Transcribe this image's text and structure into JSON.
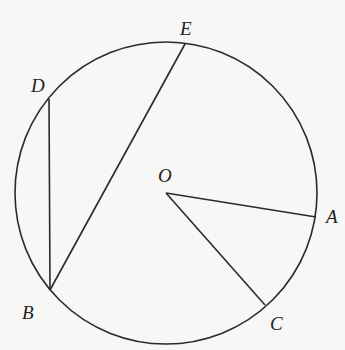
{
  "diagram": {
    "type": "circle-geometry",
    "circle": {
      "center": "O",
      "cx": 166,
      "cy": 193,
      "r": 151
    },
    "points": [
      {
        "id": "O",
        "label": "O",
        "x": 166,
        "y": 193,
        "lx": 158,
        "ly": 182
      },
      {
        "id": "A",
        "label": "A",
        "x": 316,
        "y": 217,
        "lx": 326,
        "ly": 223
      },
      {
        "id": "B",
        "label": "B",
        "x": 50,
        "y": 290,
        "lx": 22,
        "ly": 319
      },
      {
        "id": "C",
        "label": "C",
        "x": 265,
        "y": 305,
        "lx": 270,
        "ly": 330
      },
      {
        "id": "D",
        "label": "D",
        "x": 49,
        "y": 99,
        "lx": 31,
        "ly": 92
      },
      {
        "id": "E",
        "label": "E",
        "x": 185,
        "y": 44,
        "lx": 180,
        "ly": 35
      }
    ],
    "segments": [
      {
        "from": "O",
        "to": "A"
      },
      {
        "from": "O",
        "to": "C"
      },
      {
        "from": "D",
        "to": "B"
      },
      {
        "from": "B",
        "to": "E"
      }
    ]
  }
}
